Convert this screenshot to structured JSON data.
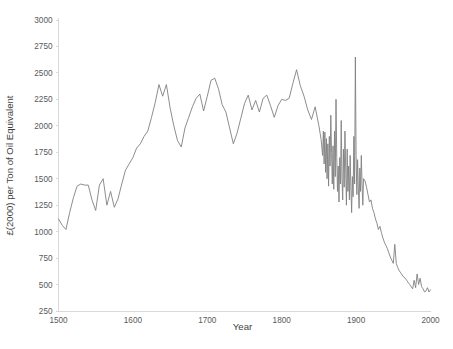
{
  "chart_data": {
    "type": "line",
    "title": "",
    "subtitle": "",
    "xlabel": "Year",
    "ylabel": "£(2000) per Ton of Oil Equivalent",
    "xlim": [
      1500,
      2000
    ],
    "ylim": [
      250,
      3000
    ],
    "xticks": [
      1500,
      1600,
      1700,
      1800,
      1900,
      2000
    ],
    "yticks": [
      250,
      500,
      750,
      1000,
      1250,
      1500,
      1750,
      2000,
      2250,
      2500,
      2750,
      3000
    ],
    "grid": false,
    "legend": "none",
    "series": [
      {
        "name": "Energy price",
        "color": "#808080",
        "x": [
          1500,
          1505,
          1510,
          1515,
          1520,
          1525,
          1530,
          1535,
          1540,
          1545,
          1550,
          1555,
          1560,
          1565,
          1570,
          1575,
          1580,
          1585,
          1590,
          1595,
          1600,
          1605,
          1610,
          1615,
          1620,
          1625,
          1630,
          1635,
          1640,
          1645,
          1650,
          1655,
          1660,
          1665,
          1670,
          1675,
          1680,
          1685,
          1690,
          1695,
          1700,
          1705,
          1710,
          1715,
          1720,
          1725,
          1730,
          1735,
          1740,
          1745,
          1750,
          1755,
          1760,
          1765,
          1770,
          1775,
          1780,
          1785,
          1790,
          1795,
          1800,
          1805,
          1810,
          1815,
          1820,
          1825,
          1830,
          1835,
          1840,
          1845,
          1850,
          1853,
          1855,
          1856,
          1857,
          1858,
          1859,
          1860,
          1861,
          1862,
          1863,
          1864,
          1865,
          1866,
          1867,
          1868,
          1869,
          1870,
          1871,
          1872,
          1873,
          1874,
          1875,
          1876,
          1877,
          1878,
          1879,
          1880,
          1881,
          1882,
          1883,
          1884,
          1885,
          1886,
          1887,
          1888,
          1889,
          1890,
          1891,
          1892,
          1893,
          1894,
          1895,
          1896,
          1897,
          1898,
          1899,
          1900,
          1901,
          1902,
          1903,
          1904,
          1905,
          1906,
          1907,
          1908,
          1909,
          1910,
          1912,
          1914,
          1916,
          1918,
          1920,
          1922,
          1924,
          1926,
          1928,
          1930,
          1932,
          1934,
          1936,
          1938,
          1940,
          1942,
          1944,
          1946,
          1948,
          1950,
          1952,
          1954,
          1956,
          1958,
          1960,
          1962,
          1964,
          1966,
          1968,
          1970,
          1972,
          1974,
          1976,
          1978,
          1980,
          1982,
          1984,
          1986,
          1988,
          1990,
          1992,
          1994,
          1996,
          1998,
          2000
        ],
        "values": [
          1120,
          1060,
          1020,
          1180,
          1320,
          1430,
          1450,
          1440,
          1440,
          1300,
          1200,
          1440,
          1500,
          1250,
          1380,
          1230,
          1310,
          1450,
          1580,
          1640,
          1700,
          1790,
          1830,
          1900,
          1950,
          2080,
          2220,
          2390,
          2280,
          2390,
          2170,
          2000,
          1860,
          1800,
          1980,
          2080,
          2180,
          2260,
          2300,
          2140,
          2280,
          2430,
          2450,
          2350,
          2200,
          2130,
          1980,
          1830,
          1930,
          2070,
          2210,
          2290,
          2150,
          2240,
          2130,
          2260,
          2290,
          2190,
          2080,
          2190,
          2250,
          2240,
          2260,
          2400,
          2530,
          2380,
          2280,
          2150,
          2060,
          2180,
          2000,
          1870,
          1720,
          1950,
          1640,
          1940,
          1560,
          1880,
          1500,
          1830,
          1430,
          1900,
          1620,
          2100,
          1750,
          1450,
          1810,
          1400,
          1950,
          1520,
          2250,
          1700,
          1380,
          1620,
          1280,
          1700,
          1450,
          2050,
          1500,
          1300,
          1780,
          1420,
          1950,
          1600,
          1250,
          1780,
          1380,
          1620,
          1300,
          1720,
          1420,
          1180,
          1520,
          1330,
          1900,
          1450,
          2650,
          1720,
          1350,
          1680,
          1420,
          1220,
          1600,
          1380,
          1720,
          1450,
          1250,
          1500,
          1480,
          1420,
          1350,
          1280,
          1300,
          1220,
          1180,
          1120,
          1080,
          1020,
          1050,
          990,
          940,
          900,
          870,
          840,
          800,
          760,
          730,
          700,
          880,
          700,
          660,
          630,
          610,
          590,
          570,
          560,
          540,
          520,
          500,
          480,
          460,
          540,
          470,
          600,
          500,
          560,
          480,
          460,
          430,
          440,
          470,
          430,
          450
        ]
      }
    ]
  },
  "axes": {
    "x_title": "Year",
    "y_title": "£(2000) per Ton of Oil Equivalent",
    "x_tick_labels": [
      "1500",
      "1600",
      "1700",
      "1800",
      "1900",
      "2000"
    ],
    "y_tick_labels": [
      "250",
      "500",
      "750",
      "1000",
      "1250",
      "1500",
      "1750",
      "2000",
      "2250",
      "2500",
      "2750",
      "3000"
    ]
  },
  "style": {
    "line_color": "#808080",
    "axis_color": "#d9d9d9",
    "tick_text_color": "#595959",
    "title_text_color": "#3f3f3f",
    "background": "#ffffff"
  }
}
